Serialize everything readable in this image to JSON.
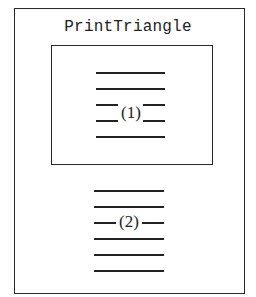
{
  "diagram": {
    "title": "PrintTriangle",
    "inner_block": {
      "label": "(1)",
      "line_count": 5
    },
    "outer_block": {
      "label": "(2)",
      "line_count": 6
    }
  }
}
